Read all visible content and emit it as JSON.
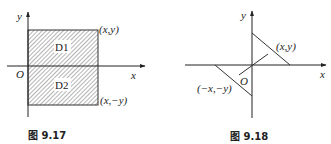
{
  "figures": [
    {
      "id": "fig-9-17",
      "caption": "图 9.17",
      "axis_labels": {
        "x": "x",
        "y": "y",
        "origin": "O"
      },
      "regions": [
        {
          "label": "D1",
          "position": "above x-axis"
        },
        {
          "label": "D2",
          "position": "below x-axis"
        }
      ],
      "points": [
        {
          "label": "(x,y)",
          "corner": "top-right"
        },
        {
          "label": "(x,−y)",
          "corner": "bottom-right"
        }
      ],
      "style": {
        "hatch": true,
        "line_color": "#333333"
      }
    },
    {
      "id": "fig-9-18",
      "caption": "图 9.18",
      "axis_labels": {
        "x": "x",
        "y": "y",
        "origin": "O"
      },
      "points": [
        {
          "label": "(x,y)",
          "quadrant": "I"
        },
        {
          "label": "(−x,−y)",
          "quadrant": "III"
        }
      ],
      "style": {
        "hatch": false,
        "line_color": "#333333"
      }
    }
  ]
}
